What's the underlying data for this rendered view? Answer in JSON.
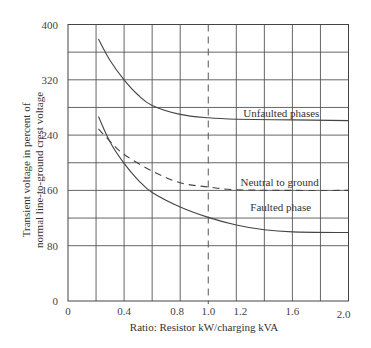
{
  "chart_data": {
    "type": "line",
    "title": "",
    "xlabel": "Ratio: Resistor kW/charging kVA",
    "ylabel_lines": [
      "Transient voltage in percent of",
      "normal line-to-ground crest voltage"
    ],
    "ylabel": "Transient voltage in percent of normal line-to-ground crest voltage",
    "xlim": [
      0,
      2.0
    ],
    "ylim": [
      0,
      400
    ],
    "x_ticks": [
      {
        "value": 0,
        "label": "0"
      },
      {
        "value": 0.4,
        "label": "0.4"
      },
      {
        "value": 0.8,
        "label": "0.8"
      },
      {
        "value": 1.0,
        "label": "1.0"
      },
      {
        "value": 1.2,
        "label": "1.2"
      },
      {
        "value": 1.6,
        "label": "1.6"
      },
      {
        "value": 2.0,
        "label": "2.0"
      }
    ],
    "y_ticks": [
      {
        "value": 0,
        "label": "0"
      },
      {
        "value": 80,
        "label": "80"
      },
      {
        "value": 160,
        "label": "160"
      },
      {
        "value": 240,
        "label": "240"
      },
      {
        "value": 320,
        "label": "320"
      },
      {
        "value": 400,
        "label": "400"
      }
    ],
    "grid": true,
    "x_gridlines": [
      0.2,
      0.4,
      0.6,
      0.8,
      1.2,
      1.4,
      1.6,
      1.8
    ],
    "y_gridlines": [
      80,
      120,
      160,
      200,
      240,
      280,
      320,
      360
    ],
    "reference_line": {
      "x": 1.0,
      "style": "dashed"
    },
    "legend": "inline annotations",
    "series": [
      {
        "name": "Unfaulted phases",
        "style": "solid",
        "x": [
          0.217,
          0.3,
          0.4,
          0.5,
          0.6,
          0.8,
          1.0,
          1.2,
          1.6,
          2.0
        ],
        "values": [
          379,
          348,
          320,
          298,
          283,
          270,
          265,
          263,
          262,
          261
        ],
        "label_pos": {
          "x": 1.25,
          "y": 272
        }
      },
      {
        "name": "Neutral to ground",
        "style": "dashed",
        "x": [
          0.217,
          0.3,
          0.4,
          0.6,
          0.8,
          1.0,
          1.2,
          1.6,
          2.0
        ],
        "values": [
          249,
          231,
          212,
          188,
          171,
          165,
          161,
          160,
          160
        ],
        "label_pos": {
          "x": 1.23,
          "y": 172
        }
      },
      {
        "name": "Faulted phase",
        "style": "solid",
        "x": [
          0.217,
          0.3,
          0.4,
          0.5,
          0.6,
          0.8,
          1.0,
          1.2,
          1.4,
          1.6,
          2.0
        ],
        "values": [
          267,
          230,
          199,
          175,
          157,
          136,
          121,
          110,
          103,
          100,
          99
        ],
        "label_pos": {
          "x": 1.3,
          "y": 136
        }
      }
    ]
  }
}
